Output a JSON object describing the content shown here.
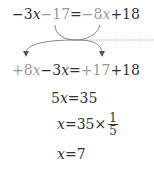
{
  "steps": [
    {
      "parts": [
        "−3",
        "x",
        "−17",
        "=",
        "−8",
        "x",
        "+18"
      ]
    },
    {
      "parts": [
        "+8",
        "x",
        "−3",
        "x",
        "=",
        "+17",
        "+18"
      ]
    },
    {
      "parts": [
        "5",
        "x",
        "=35"
      ]
    },
    {
      "parts": [
        "x",
        "=35×",
        "1",
        "5"
      ]
    },
    {
      "parts": [
        "x",
        "=7"
      ]
    }
  ],
  "colors": {
    "text": "#333333",
    "moved_term": "#9a9a9a",
    "arrow": "#666666"
  }
}
